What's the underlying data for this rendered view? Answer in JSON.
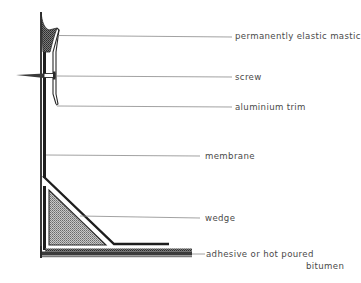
{
  "diagram": {
    "colors": {
      "line": "#2a2a2a",
      "leader": "#8a8a8a",
      "text": "#4a4a4a",
      "hatch": "#9a9a9a"
    },
    "labels": [
      {
        "id": "mastic",
        "text": "permanently elastic mastic"
      },
      {
        "id": "screw",
        "text": "screw"
      },
      {
        "id": "trim",
        "text": "aluminium trim"
      },
      {
        "id": "membrane",
        "text": "membrane"
      },
      {
        "id": "wedge",
        "text": "wedge"
      },
      {
        "id": "adhesive",
        "text": "adhesive or hot poured"
      },
      {
        "id": "adhesive_line2",
        "text": "bitumen"
      }
    ]
  }
}
